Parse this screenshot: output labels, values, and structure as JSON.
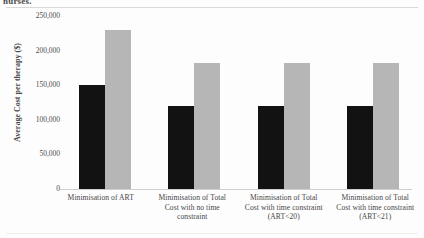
{
  "figure": {
    "caption_fragment": "nurses.",
    "background_color": "#fdfdfd"
  },
  "chart_data": {
    "type": "bar",
    "title": "",
    "subtitle": "",
    "xlabel": "",
    "ylabel": "Average Cost per therapy ($)",
    "categories": [
      "Minimisation of ART",
      "Minimisation of Total Cost with no time constraint",
      "Minimisation of Total Cost with time constraint (ART<20)",
      "Minimisation of Total Cost with time constraint (ART<21)"
    ],
    "category_lines": [
      [
        "Minimisation of ART"
      ],
      [
        "Minimisation of Total",
        "Cost with no time",
        "constraint"
      ],
      [
        "Minimisation of Total",
        "Cost with time constraint",
        "(ART<20)"
      ],
      [
        "Minimisation of Total",
        "Cost with time constraint",
        "(ART<21)"
      ]
    ],
    "series": [
      {
        "name": "Series 1",
        "color": "#121212",
        "values": [
          150000,
          120000,
          120000,
          120000
        ]
      },
      {
        "name": "Series 2",
        "color": "#b6b6b6",
        "values": [
          230000,
          182000,
          182000,
          182000
        ]
      }
    ],
    "ylim": [
      0,
      250000
    ],
    "ytick_values": [
      250000,
      200000,
      150000,
      100000,
      50000,
      0
    ],
    "ytick_labels": [
      "250,000",
      "200,000",
      "150,000",
      "100,000",
      "50,000",
      "0"
    ],
    "grid": false,
    "legend": null,
    "legend_position": "none"
  }
}
